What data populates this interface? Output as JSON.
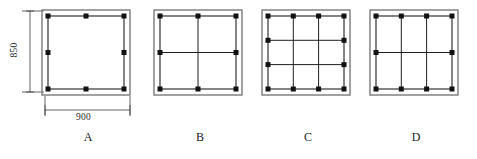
{
  "diagram": {
    "background_color": "#ffffff",
    "line_color": "#1f1f1f",
    "concrete_outline_color": "#6e6e6e",
    "rebar_color": "#111111",
    "dimensions": {
      "height_label": "850",
      "width_label": "900",
      "unit_note": ""
    },
    "options": [
      {
        "id": "A",
        "label": "A",
        "columns": 1,
        "rows": 1,
        "inner_vertical_ties": 0,
        "inner_horizontal_ties": 0,
        "rebar_count": 8,
        "description": "Single perimeter stirrup with 8 longitudinal bars (corners plus mid-side)"
      },
      {
        "id": "B",
        "label": "B",
        "columns": 2,
        "rows": 2,
        "inner_vertical_ties": 1,
        "inner_horizontal_ties": 1,
        "rebar_count": 8,
        "description": "Perimeter stirrup with one vertical and one horizontal cross tie, 2x2 grid"
      },
      {
        "id": "C",
        "label": "C",
        "columns": 3,
        "rows": 3,
        "inner_vertical_ties": 2,
        "inner_horizontal_ties": 2,
        "rebar_count": 12,
        "description": "Perimeter stirrup with two vertical and two horizontal cross ties, 3x3 grid"
      },
      {
        "id": "D",
        "label": "D",
        "columns": 3,
        "rows": 2,
        "inner_vertical_ties": 2,
        "inner_horizontal_ties": 1,
        "rebar_count": 10,
        "description": "Perimeter stirrup with two vertical and one horizontal cross tie, 3x2 grid"
      }
    ]
  }
}
